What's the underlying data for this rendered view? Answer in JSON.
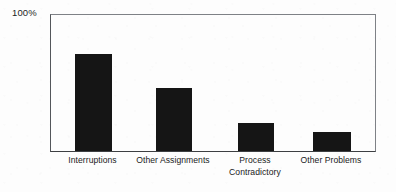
{
  "chart_data": {
    "type": "bar",
    "title": "",
    "subtitle": "",
    "xlabel": "",
    "ylabel": "",
    "ylim": [
      0,
      100
    ],
    "y_tick_labels": [
      "100%"
    ],
    "grid": false,
    "legend": null,
    "orientation": "vertical",
    "bar_color": "#151515",
    "categories": [
      "Interruptions",
      "Other Assignments",
      "Process Contradictory",
      "Other Problems"
    ],
    "category_lines": [
      [
        "Interruptions"
      ],
      [
        "Other Assignments"
      ],
      [
        "Process",
        "Contradictory"
      ],
      [
        "Other Problems"
      ]
    ],
    "values": [
      70,
      46,
      20,
      14
    ],
    "value_unit": "%"
  },
  "axes": {
    "y_max_label": "100%",
    "y_max_value": 100,
    "frame_color": "#53565a",
    "baseline_color": "#3d3f42"
  },
  "figure": {
    "background": "#fdfdfd",
    "width": 396,
    "height": 192
  }
}
